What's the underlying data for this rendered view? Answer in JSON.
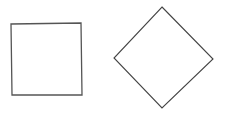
{
  "canvas": {
    "width": 225,
    "height": 113,
    "background": "#ffffff"
  },
  "shapes": [
    {
      "name": "square",
      "type": "polygon",
      "points": "11,24 81,23 82,95 12,95",
      "stroke": "#555555",
      "stroke_width": 1.3,
      "fill": "#ffffff"
    },
    {
      "name": "diamond",
      "type": "polygon",
      "points": "162,7 213,59 162,108 114,58",
      "stroke": "#444444",
      "stroke_width": 1.1,
      "fill": "#ffffff"
    }
  ]
}
